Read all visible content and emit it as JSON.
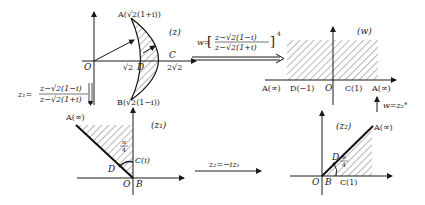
{
  "panels": {
    "z": {
      "plane_label": "(z)",
      "origin": "O",
      "point_A": "A(√2(1+i))",
      "point_B": "B(√2(1−i))",
      "point_C": "C",
      "point_D": "D",
      "tick_sqrt2": "√2",
      "tick_2sqrt2": "2√2"
    },
    "w": {
      "plane_label": "(w)",
      "origin": "O",
      "label_A_left": "A(∞)",
      "label_D": "D(−1)",
      "label_C": "C(1)",
      "label_A_right": "A(∞)"
    },
    "z1": {
      "plane_label": "(z₁)",
      "origin": "O",
      "point_B": "B",
      "point_A": "A(∞)",
      "point_C": "C(i)",
      "point_D": "D",
      "angle": "π/4",
      "angle_num": "π",
      "angle_den": "4"
    },
    "z2": {
      "plane_label": "(z₂)",
      "origin": "O",
      "point_B": "B",
      "point_C": "C(1)",
      "point_A": "A(∞)",
      "point_D": "D",
      "angle_num": "π",
      "angle_den": "4"
    }
  },
  "mappings": {
    "z_to_w": {
      "lhs": "w=",
      "numerator": "z−√2(1−i)",
      "denominator": "z−√2(1+i)",
      "exponent": "4"
    },
    "z_to_z1": {
      "lhs": "z₁=",
      "numerator": "z−√2(1−i)",
      "denominator": "z−√2(1+i)"
    },
    "z1_to_z2": {
      "formula": "z₂=−iz₁"
    },
    "z2_to_w": {
      "formula": "w=z₂⁴"
    }
  }
}
